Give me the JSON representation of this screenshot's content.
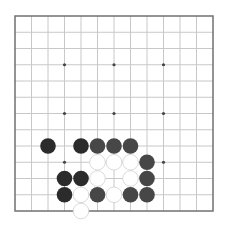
{
  "board": {
    "size_lines": 13,
    "origin_x": 15,
    "origin_y": 16,
    "spacing_x": 16.5,
    "spacing_y": 16.25,
    "stone_radius": 7.8,
    "colors": {
      "background": "#ffffff",
      "grid": "#c8c8c8",
      "border": "#707070",
      "star": "#444444",
      "black": "#2b2b2b",
      "dark": "#474747",
      "white": "#ffffff"
    },
    "star_points": [
      {
        "col": 3,
        "row": 3
      },
      {
        "col": 6,
        "row": 3
      },
      {
        "col": 9,
        "row": 3
      },
      {
        "col": 3,
        "row": 6
      },
      {
        "col": 6,
        "row": 6
      },
      {
        "col": 9,
        "row": 6
      },
      {
        "col": 3,
        "row": 9
      },
      {
        "col": 9,
        "row": 9
      }
    ],
    "stones": [
      {
        "col": 2,
        "row": 8,
        "color": "black"
      },
      {
        "col": 4,
        "row": 8,
        "color": "black"
      },
      {
        "col": 5,
        "row": 8,
        "color": "dark"
      },
      {
        "col": 6,
        "row": 8,
        "color": "dark"
      },
      {
        "col": 7,
        "row": 8,
        "color": "dark"
      },
      {
        "col": 5,
        "row": 9,
        "color": "white"
      },
      {
        "col": 6,
        "row": 9,
        "color": "white"
      },
      {
        "col": 7,
        "row": 9,
        "color": "white"
      },
      {
        "col": 8,
        "row": 9,
        "color": "dark"
      },
      {
        "col": 3,
        "row": 10,
        "color": "black"
      },
      {
        "col": 4,
        "row": 10,
        "color": "black"
      },
      {
        "col": 5,
        "row": 10,
        "color": "white"
      },
      {
        "col": 7,
        "row": 10,
        "color": "white"
      },
      {
        "col": 8,
        "row": 10,
        "color": "dark"
      },
      {
        "col": 3,
        "row": 11,
        "color": "black"
      },
      {
        "col": 4,
        "row": 11,
        "color": "white"
      },
      {
        "col": 5,
        "row": 11,
        "color": "dark"
      },
      {
        "col": 6,
        "row": 11,
        "color": "white"
      },
      {
        "col": 7,
        "row": 11,
        "color": "dark"
      },
      {
        "col": 8,
        "row": 11,
        "color": "dark"
      },
      {
        "col": 4,
        "row": 12,
        "color": "white"
      }
    ]
  }
}
